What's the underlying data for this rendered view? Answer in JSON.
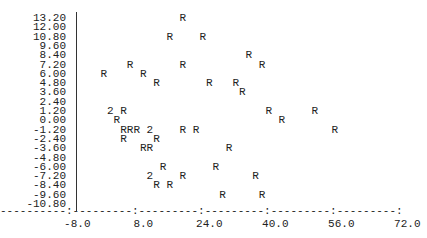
{
  "chart_data": {
    "type": "scatter",
    "title": "",
    "xlabel": "",
    "ylabel": "",
    "marker": "R",
    "overlap_marker_note": "digit = number of coincident points",
    "xlim": [
      -8.0,
      72.0
    ],
    "ylim": [
      -10.8,
      13.2
    ],
    "grid": false,
    "x_ticks": [
      "-8.0",
      "8.0",
      "24.0",
      "40.0",
      "56.0",
      "72.0"
    ],
    "y_ticks": [
      "13.20",
      "12.00",
      "10.80",
      "9.60",
      "8.40",
      "7.20",
      "6.00",
      "4.80",
      "3.60",
      "2.40",
      "1.20",
      "0.00",
      "-1.20",
      "-2.40",
      "-3.60",
      "-4.80",
      "-6.00",
      "-7.20",
      "-8.40",
      "-9.60",
      "-10.80"
    ],
    "points": [
      {
        "x": 17.6,
        "y": 13.2,
        "label": "R"
      },
      {
        "x": 14.4,
        "y": 10.8,
        "label": "R"
      },
      {
        "x": 22.4,
        "y": 10.8,
        "label": "R"
      },
      {
        "x": 33.6,
        "y": 8.4,
        "label": "R"
      },
      {
        "x": 4.8,
        "y": 7.2,
        "label": "R"
      },
      {
        "x": 17.6,
        "y": 7.2,
        "label": "R"
      },
      {
        "x": 36.8,
        "y": 7.2,
        "label": "R"
      },
      {
        "x": -1.6,
        "y": 6.0,
        "label": "R"
      },
      {
        "x": 8.0,
        "y": 6.0,
        "label": "R"
      },
      {
        "x": 11.2,
        "y": 4.8,
        "label": "R"
      },
      {
        "x": 24.0,
        "y": 4.8,
        "label": "R"
      },
      {
        "x": 30.4,
        "y": 4.8,
        "label": "R"
      },
      {
        "x": 32.0,
        "y": 3.6,
        "label": "R"
      },
      {
        "x": 0.0,
        "y": 1.2,
        "label": "2"
      },
      {
        "x": 3.2,
        "y": 1.2,
        "label": "R"
      },
      {
        "x": 38.4,
        "y": 1.2,
        "label": "R"
      },
      {
        "x": 49.6,
        "y": 1.2,
        "label": "R"
      },
      {
        "x": 1.6,
        "y": 0.0,
        "label": "R"
      },
      {
        "x": 41.6,
        "y": 0.0,
        "label": "R"
      },
      {
        "x": 3.2,
        "y": -1.2,
        "label": "R"
      },
      {
        "x": 4.8,
        "y": -1.2,
        "label": "R"
      },
      {
        "x": 6.4,
        "y": -1.2,
        "label": "R"
      },
      {
        "x": 9.6,
        "y": -1.2,
        "label": "2"
      },
      {
        "x": 17.6,
        "y": -1.2,
        "label": "R"
      },
      {
        "x": 20.8,
        "y": -1.2,
        "label": "R"
      },
      {
        "x": 54.4,
        "y": -1.2,
        "label": "R"
      },
      {
        "x": 3.2,
        "y": -2.4,
        "label": "R"
      },
      {
        "x": 11.2,
        "y": -2.4,
        "label": "R"
      },
      {
        "x": 8.0,
        "y": -3.6,
        "label": "R"
      },
      {
        "x": 9.6,
        "y": -3.6,
        "label": "R"
      },
      {
        "x": 28.8,
        "y": -3.6,
        "label": "R"
      },
      {
        "x": 12.8,
        "y": -6.0,
        "label": "R"
      },
      {
        "x": 25.6,
        "y": -6.0,
        "label": "R"
      },
      {
        "x": 9.6,
        "y": -7.2,
        "label": "2"
      },
      {
        "x": 17.6,
        "y": -7.2,
        "label": "R"
      },
      {
        "x": 35.2,
        "y": -7.2,
        "label": "R"
      },
      {
        "x": 11.2,
        "y": -8.4,
        "label": "R"
      },
      {
        "x": 14.4,
        "y": -8.4,
        "label": "R"
      },
      {
        "x": 27.2,
        "y": -9.6,
        "label": "R"
      },
      {
        "x": 36.8,
        "y": -9.6,
        "label": "R"
      }
    ]
  },
  "axis": {
    "x_dash_line": "----------:---------:---------:---------:---------:---------:"
  }
}
